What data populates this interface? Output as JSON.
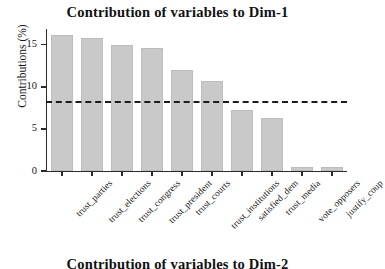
{
  "chart_data": {
    "type": "bar",
    "title": "Contribution of variables to Dim-1",
    "xlabel": "",
    "ylabel": "Contributions (%)",
    "categories": [
      "trust_parties",
      "trust_elections",
      "trust_congress",
      "trust_president",
      "trust_courts",
      "trust_institutions",
      "satisfied_dem",
      "trust_media",
      "vote_opposers",
      "justify_coup"
    ],
    "values": [
      16.2,
      15.8,
      15.0,
      14.6,
      12.0,
      10.7,
      7.2,
      6.3,
      0.5,
      0.5
    ],
    "ylim": [
      0,
      17
    ],
    "yticks": [
      0,
      5,
      10,
      15
    ],
    "ytick_labels": [
      "0",
      "5",
      "10",
      "15"
    ],
    "grid": false,
    "legend": "none",
    "reference_line": {
      "value": 8.3,
      "style": "dashed",
      "color": "#1c1c1c",
      "label": "expected average contribution"
    },
    "bar_color": "#c9c9c9",
    "bar_edge_color": "#bdbdbd",
    "axis_color": "#2b2b2b"
  },
  "next_panel": {
    "title": "Contribution of variables to Dim-2"
  }
}
